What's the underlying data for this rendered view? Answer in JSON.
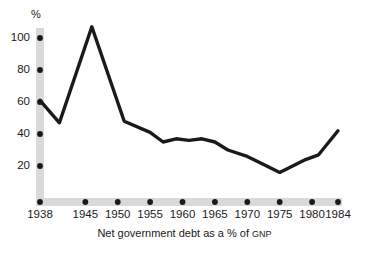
{
  "chart_data": {
    "type": "line",
    "title": "",
    "caption": "Net government debt as a % of GNP",
    "caption_main": "Net government debt as a % of ",
    "caption_smallcaps": "GNP",
    "ylabel": "%",
    "xlabel": "",
    "ylim": [
      0,
      110
    ],
    "xlim": [
      1938,
      1984
    ],
    "grid": false,
    "legend": "none",
    "yticks": [
      100,
      80,
      60,
      40,
      20
    ],
    "ytick_labels": [
      "100",
      "80",
      "60",
      "40",
      "20"
    ],
    "xticks": [
      1938,
      1945,
      1950,
      1955,
      1960,
      1965,
      1970,
      1975,
      1980,
      1984
    ],
    "xtick_labels": [
      "1938",
      "1945",
      "1950",
      "1955",
      "1960",
      "1965",
      "1970",
      "1975",
      "1980",
      "1984"
    ],
    "series": [
      {
        "name": "Net government debt as a % of GNP",
        "color": "#1a1a1a",
        "x": [
          1938,
          1941,
          1946,
          1951,
          1955,
          1957,
          1959,
          1961,
          1963,
          1965,
          1967,
          1970,
          1973,
          1975,
          1979,
          1981,
          1984
        ],
        "values": [
          61,
          47,
          107,
          48,
          41,
          35,
          37,
          36,
          37,
          35,
          30,
          26,
          20,
          16,
          24,
          27,
          42
        ]
      }
    ],
    "colors": {
      "line": "#1a1a1a",
      "axis_band": "#d9d9d9",
      "tick_dot": "#1a1a1a",
      "text": "#1a1a1a",
      "background": "#ffffff"
    }
  }
}
